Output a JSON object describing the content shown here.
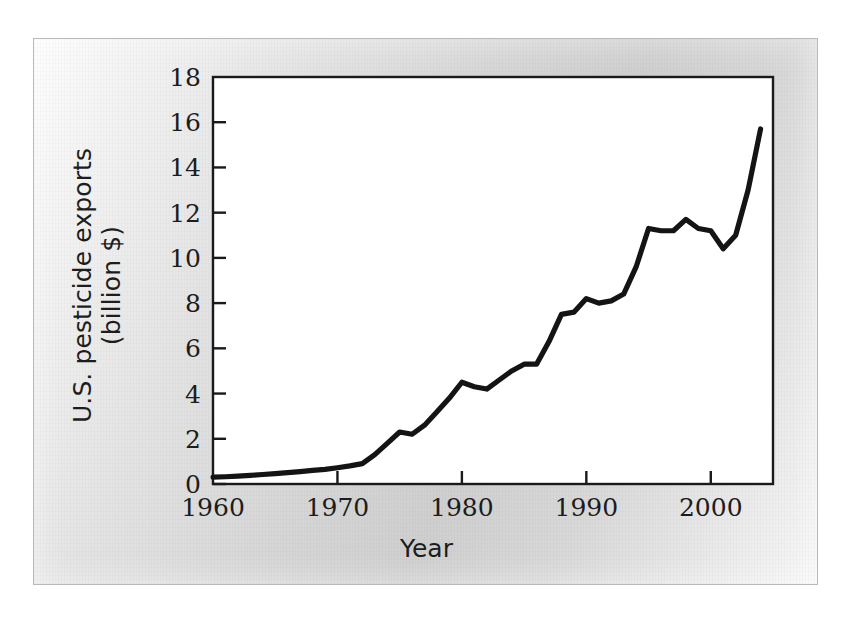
{
  "figure": {
    "background_color": "#d9d9d9",
    "plot_background_color": "#ffffff",
    "line_color": "#141414",
    "axis_color": "#1a1a1a"
  },
  "chart_data": {
    "type": "line",
    "title": "",
    "xlabel": "Year",
    "ylabel": "U.S. pesticide exports\n(billion $)",
    "ylabel_lines": [
      "U.S. pesticide exports",
      "(billion $)"
    ],
    "xlim": [
      1960,
      2005
    ],
    "ylim": [
      0,
      18
    ],
    "grid": false,
    "legend": null,
    "xticks": [
      1960,
      1970,
      1980,
      1990,
      2000
    ],
    "xtick_labels": [
      "1960",
      "1970",
      "1980",
      "1990",
      "2000"
    ],
    "yticks": [
      0,
      2,
      4,
      6,
      8,
      10,
      12,
      14,
      16,
      18
    ],
    "ytick_labels": [
      "0",
      "2",
      "4",
      "6",
      "8",
      "10",
      "12",
      "14",
      "16",
      "18"
    ],
    "series": [
      {
        "name": "U.S. pesticide exports",
        "x": [
          1960,
          1961,
          1962,
          1963,
          1964,
          1965,
          1966,
          1967,
          1968,
          1969,
          1970,
          1971,
          1972,
          1973,
          1974,
          1975,
          1976,
          1977,
          1978,
          1979,
          1980,
          1981,
          1982,
          1983,
          1984,
          1985,
          1986,
          1987,
          1988,
          1989,
          1990,
          1991,
          1992,
          1993,
          1994,
          1995,
          1996,
          1997,
          1998,
          1999,
          2000,
          2001,
          2002,
          2003,
          2004
        ],
        "values": [
          0.3,
          0.32,
          0.35,
          0.38,
          0.42,
          0.46,
          0.5,
          0.55,
          0.6,
          0.65,
          0.72,
          0.8,
          0.9,
          1.3,
          1.8,
          2.3,
          2.2,
          2.6,
          3.2,
          3.8,
          4.5,
          4.3,
          4.2,
          4.6,
          5.0,
          5.3,
          5.3,
          6.3,
          7.5,
          7.6,
          8.2,
          8.0,
          8.1,
          8.4,
          9.6,
          11.3,
          11.2,
          11.2,
          11.7,
          11.3,
          11.2,
          10.4,
          11.0,
          13.0,
          15.7
        ]
      }
    ]
  }
}
